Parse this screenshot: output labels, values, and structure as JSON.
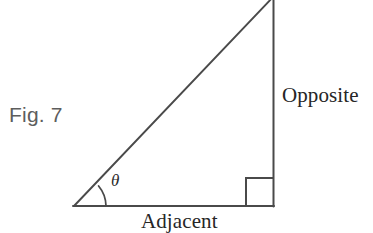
{
  "figure": {
    "caption": "Fig. 7",
    "background_color": "#ffffff",
    "stroke_color": "#4a4a4a",
    "text_color": "#262626",
    "caption_color": "#5d5d5d"
  },
  "labels": {
    "opposite": "Opposite",
    "adjacent": "Adjacent",
    "angle_symbol": "θ"
  },
  "geometry": {
    "type": "right-triangle",
    "vertices": {
      "left": [
        74,
        206
      ],
      "top": [
        273,
        0
      ],
      "bottom_right": [
        273,
        206
      ]
    },
    "angle_arc_radius": 32,
    "right_angle_marker_size": 27
  }
}
